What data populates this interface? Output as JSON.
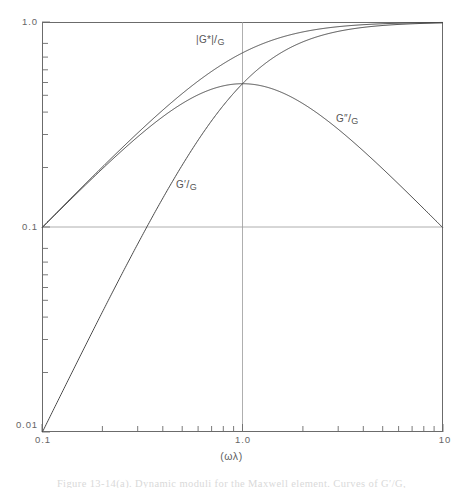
{
  "figure": {
    "caption": "Figure 13-14(a).  Dynamic moduli for the Maxwell element. Curves of G′/G,"
  },
  "axes": {
    "x_title": "(ωλ)",
    "x_ticks": [
      {
        "label": "0.1",
        "value": 0.1
      },
      {
        "label": "1.0",
        "value": 1.0
      },
      {
        "label": "10",
        "value": 10
      }
    ],
    "y_ticks": [
      {
        "label": "1.0",
        "value": 1.0
      },
      {
        "label": "0.1",
        "value": 0.1
      },
      {
        "label": "0.01",
        "value": 0.01
      }
    ],
    "x_scale": "log",
    "y_scale": "log",
    "x_range": [
      0.1,
      10
    ],
    "y_range": [
      0.01,
      1.0
    ],
    "frame_color": "#6b6b6b",
    "gridline_color": "#8c8c8c"
  },
  "annotations": [
    {
      "name": "complex-modulus-label",
      "numerator": "|G*|",
      "denominator": "G",
      "x_px": 196,
      "y_px": 33
    },
    {
      "name": "loss-modulus-label",
      "numerator": "G″",
      "denominator": "G",
      "x_px": 336,
      "y_px": 112
    },
    {
      "name": "storage-modulus-label",
      "numerator": "G′",
      "denominator": "G",
      "x_px": 176,
      "y_px": 178
    }
  ],
  "chart_data": {
    "type": "line",
    "title": "",
    "subtitle": "",
    "xlabel": "(ωλ)",
    "ylabel": "",
    "xscale": "log",
    "yscale": "log",
    "xlim": [
      0.1,
      10
    ],
    "ylim": [
      0.01,
      1.0
    ],
    "grid": true,
    "legend_position": "inline-annotations",
    "x": [
      0.1,
      0.125,
      0.158,
      0.2,
      0.251,
      0.316,
      0.398,
      0.501,
      0.631,
      0.794,
      1.0,
      1.259,
      1.585,
      1.995,
      2.512,
      3.162,
      3.981,
      5.012,
      6.31,
      7.943,
      10.0
    ],
    "series": [
      {
        "name": "G'/G",
        "label": "G′/G",
        "formula": "(wl)^2 / (1 + (wl)^2)",
        "values": [
          0.0099,
          0.0154,
          0.0244,
          0.0385,
          0.0593,
          0.0909,
          0.1368,
          0.2007,
          0.2848,
          0.3866,
          0.5,
          0.6133,
          0.7152,
          0.7993,
          0.8632,
          0.9091,
          0.9407,
          0.9617,
          0.9755,
          0.9844,
          0.9901
        ]
      },
      {
        "name": "G''/G",
        "label": "G″/G",
        "formula": "(wl) / (1 + (wl)^2)",
        "values": [
          0.099,
          0.1232,
          0.1545,
          0.1923,
          0.2364,
          0.2875,
          0.3437,
          0.4005,
          0.4513,
          0.4868,
          0.5,
          0.4872,
          0.4513,
          0.4006,
          0.3436,
          0.2875,
          0.2363,
          0.1919,
          0.1546,
          0.1239,
          0.099
        ]
      },
      {
        "name": "|G*|/G",
        "label": "|G*|/G",
        "formula": "(wl) / sqrt(1 + (wl)^2)",
        "values": [
          0.0995,
          0.124,
          0.1561,
          0.1961,
          0.2437,
          0.3016,
          0.3699,
          0.4479,
          0.5336,
          0.6221,
          0.7071,
          0.7831,
          0.8458,
          0.8942,
          0.9292,
          0.9535,
          0.9699,
          0.9806,
          0.9877,
          0.9921,
          0.995
        ]
      }
    ],
    "crossover_point": {
      "x": 1.0,
      "y": 0.5
    }
  }
}
